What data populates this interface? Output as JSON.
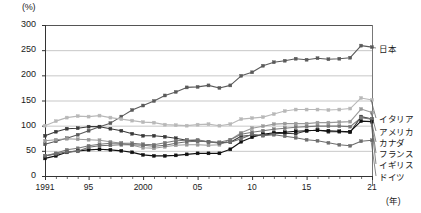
{
  "chart_data": {
    "type": "line",
    "title": "",
    "xlabel": "(年)",
    "ylabel": "(%)",
    "ylim": [
      0,
      300
    ],
    "xlim": [
      1991,
      2021
    ],
    "grid": true,
    "legend_position": "right-of-plot",
    "yticks": [
      "0",
      "50",
      "100",
      "150",
      "200",
      "250",
      "300"
    ],
    "ytick_values": [
      0,
      50,
      100,
      150,
      200,
      250,
      300
    ],
    "xticks": [
      "1991",
      "95",
      "2000",
      "05",
      "10",
      "15",
      "21"
    ],
    "xtick_values": [
      1991,
      1995,
      2000,
      2005,
      2010,
      2015,
      2021
    ],
    "x": [
      1991,
      1992,
      1993,
      1994,
      1995,
      1996,
      1997,
      1998,
      1999,
      2000,
      2001,
      2002,
      2003,
      2004,
      2005,
      2006,
      2007,
      2008,
      2009,
      2010,
      2011,
      2012,
      2013,
      2014,
      2015,
      2016,
      2017,
      2018,
      2019,
      2020,
      2021
    ],
    "series": [
      {
        "name": "日本",
        "color": "#5a5a5a",
        "values": [
          63,
          69,
          75,
          82,
          90,
          98,
          105,
          118,
          131,
          140,
          149,
          160,
          167,
          176,
          177,
          180,
          175,
          180,
          199,
          206,
          219,
          226,
          229,
          233,
          231,
          234,
          232,
          233,
          235,
          259,
          256
        ]
      },
      {
        "name": "イタリア",
        "color": "#b8b8b8",
        "values": [
          100,
          109,
          116,
          119,
          118,
          120,
          116,
          113,
          110,
          107,
          106,
          102,
          101,
          100,
          102,
          103,
          100,
          103,
          113,
          115,
          117,
          123,
          129,
          132,
          132,
          132,
          131,
          132,
          134,
          155,
          151
        ]
      },
      {
        "name": "アメリカ",
        "color": "#9a9a9a",
        "values": [
          70,
          72,
          74,
          73,
          72,
          71,
          68,
          65,
          61,
          56,
          55,
          58,
          61,
          62,
          62,
          61,
          62,
          72,
          86,
          95,
          99,
          103,
          104,
          104,
          104,
          106,
          106,
          107,
          108,
          133,
          126
        ]
      },
      {
        "name": "カナダ",
        "color": "#3a3a3a",
        "values": [
          80,
          88,
          94,
          95,
          98,
          98,
          94,
          90,
          84,
          80,
          80,
          78,
          75,
          71,
          70,
          68,
          66,
          67,
          79,
          81,
          81,
          84,
          85,
          84,
          90,
          91,
          88,
          88,
          87,
          118,
          113
        ]
      },
      {
        "name": "フランス",
        "color": "#787878",
        "values": [
          40,
          45,
          52,
          55,
          60,
          63,
          65,
          65,
          65,
          63,
          62,
          66,
          70,
          71,
          72,
          68,
          67,
          72,
          83,
          87,
          90,
          93,
          95,
          97,
          98,
          99,
          99,
          99,
          98,
          116,
          113
        ]
      },
      {
        "name": "イギリス",
        "color": "#111111",
        "values": [
          35,
          40,
          47,
          50,
          52,
          53,
          52,
          50,
          47,
          42,
          40,
          40,
          41,
          43,
          45,
          45,
          45,
          53,
          68,
          77,
          83,
          86,
          87,
          89,
          90,
          91,
          90,
          89,
          88,
          109,
          108
        ]
      },
      {
        "name": "ドイツ",
        "color": "#6e6e6e",
        "values": [
          40,
          44,
          48,
          49,
          57,
          60,
          61,
          62,
          62,
          61,
          59,
          61,
          65,
          68,
          69,
          68,
          65,
          67,
          74,
          83,
          80,
          82,
          79,
          76,
          72,
          70,
          66,
          62,
          60,
          69,
          71
        ]
      }
    ]
  },
  "axes": {
    "y_unit": "(%)",
    "x_unit": "(年)"
  }
}
